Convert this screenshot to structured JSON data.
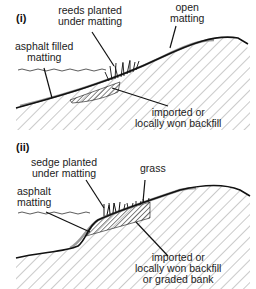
{
  "panels": [
    {
      "id": "i",
      "label": "(i)",
      "annotations": {
        "reeds": [
          "reeds planted",
          "under matting"
        ],
        "open_matting": [
          "open",
          "matting"
        ],
        "asphalt": [
          "asphalt filled",
          "matting"
        ],
        "backfill": [
          "imported or",
          "locally won backfill"
        ]
      }
    },
    {
      "id": "ii",
      "label": "(ii)",
      "annotations": {
        "sedge": [
          "sedge planted",
          "under matting"
        ],
        "grass": [
          "grass"
        ],
        "asphalt": [
          "asphalt",
          "matting"
        ],
        "backfill": [
          "imported or",
          "locally won backfill",
          "or graded bank"
        ]
      }
    }
  ],
  "colors": {
    "line": "#111111",
    "hatch": "#555555",
    "matting": "#9a9a9a"
  }
}
